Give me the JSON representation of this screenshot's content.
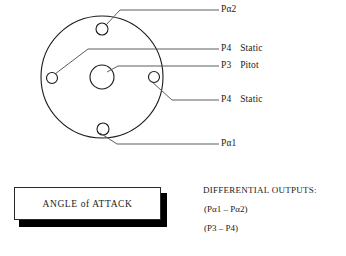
{
  "figure": {
    "name": "angle-of-attack-probe-face"
  },
  "probe": {
    "body_circle": {
      "cx": 102,
      "cy": 77,
      "r": 61
    },
    "center_port": {
      "cx": 102,
      "cy": 77,
      "r": 12,
      "name": "P3 Pitot"
    },
    "ports": [
      {
        "id": "top",
        "cx": 102,
        "cy": 29,
        "r": 6,
        "name": "Pα2"
      },
      {
        "id": "left",
        "cx": 52,
        "cy": 78,
        "r": 5.5,
        "name": "P4 Static"
      },
      {
        "id": "right",
        "cx": 154,
        "cy": 77,
        "r": 5.5,
        "name": "P4 Static"
      },
      {
        "id": "bottom",
        "cx": 103,
        "cy": 129,
        "r": 6,
        "name": "Pα1"
      }
    ]
  },
  "callouts": [
    {
      "code": "Pα2",
      "qualifier": "",
      "x": 221,
      "y": 6
    },
    {
      "code": "P4",
      "qualifier": "Static",
      "x": 221,
      "y": 44
    },
    {
      "code": "P3",
      "qualifier": "Pitot",
      "x": 221,
      "y": 62
    },
    {
      "code": "P4",
      "qualifier": "Static",
      "x": 221,
      "y": 95
    },
    {
      "code": "Pα1",
      "qualifier": "",
      "x": 221,
      "y": 139
    }
  ],
  "aoa_box": {
    "label": "ANGLE of ATTACK"
  },
  "differential_outputs": {
    "title": "DIFFERENTIAL OUTPUTS:",
    "expressions": [
      "(Pα1 – Pα2)",
      "(P3 – P4)"
    ]
  },
  "colors": {
    "ink": "#1a1a1a",
    "leader": "#4a4a4a",
    "shadow": "#000000",
    "paper": "#ffffff"
  }
}
